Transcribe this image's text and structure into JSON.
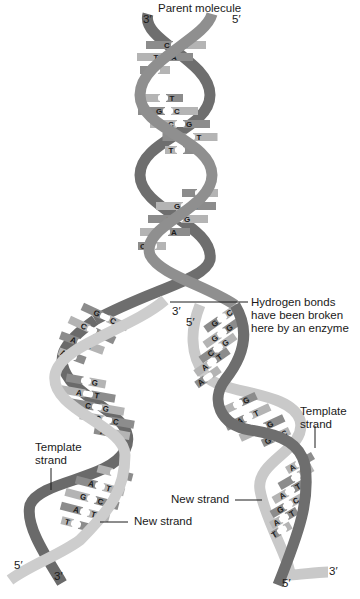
{
  "title": "Parent molecule",
  "labels": {
    "parent_molecule": "Parent molecule",
    "hydrogen_bonds_line1": "Hydrogen bonds",
    "hydrogen_bonds_line2": "have been broken",
    "hydrogen_bonds_line3": "here by an enzyme",
    "template_strand_left_line1": "Template",
    "template_strand_left_line2": "strand",
    "template_strand_right_line1": "Template",
    "template_strand_right_line2": "strand",
    "new_strand_left": "New strand",
    "new_strand_right": "New strand"
  },
  "ends": {
    "top_left": "3′",
    "top_right": "5′",
    "fork_left": "3′",
    "fork_right": "5′",
    "bottom_left_5": "5′",
    "bottom_left_3": "3′",
    "bottom_right_3": "3′",
    "bottom_right_5": "5′"
  },
  "parent_pairs": [
    [
      "C",
      "G"
    ],
    [
      "T",
      "A"
    ],
    [
      "",
      ""
    ],
    [
      "",
      "T"
    ],
    [
      "G",
      "C"
    ],
    [
      "C",
      "G"
    ],
    [
      "A",
      "T"
    ],
    [
      "T",
      ""
    ],
    [
      "",
      "T"
    ],
    [
      "G",
      "C"
    ],
    [
      "C",
      "G"
    ],
    [
      "T",
      "A"
    ],
    [
      "C",
      ""
    ]
  ],
  "fork_bases": {
    "left": [
      "A",
      "C",
      "G",
      "A"
    ],
    "right": [
      "T",
      "C",
      "G",
      "T"
    ]
  },
  "left_daughter_pairs": [
    [
      "G",
      "C"
    ],
    [
      "C",
      "G"
    ],
    [
      "A",
      "T"
    ],
    [
      "A",
      ""
    ],
    [
      "",
      "G"
    ],
    [
      "A",
      "T"
    ],
    [
      "C",
      "G"
    ],
    [
      "G",
      "C"
    ],
    [
      "A",
      ""
    ],
    [
      "",
      "T"
    ],
    [
      "A",
      "T"
    ],
    [
      "G",
      "C"
    ],
    [
      "A",
      "T"
    ],
    [
      "T",
      ""
    ]
  ],
  "right_daughter_pairs": [
    [
      "G",
      "C"
    ],
    [
      "G",
      "G"
    ],
    [
      "C",
      "G"
    ],
    [
      "A",
      "T"
    ],
    [
      "A",
      ""
    ],
    [
      "",
      "G"
    ],
    [
      "A",
      "T"
    ],
    [
      "C",
      "G"
    ],
    [
      "G",
      "C"
    ],
    [
      "A",
      ""
    ],
    [
      "",
      "T"
    ],
    [
      "A",
      "T"
    ],
    [
      "G",
      "C"
    ],
    [
      "A",
      "T"
    ],
    [
      "T",
      ""
    ]
  ],
  "colors": {
    "template_strand": "#7a7a7a",
    "template_strand_dark": "#5a5a5a",
    "new_strand": "#c8c8c8",
    "rung_dark": "#8c8c8c",
    "rung_light": "#b4b4b4",
    "hbond": "#ffffff",
    "text": "#1a1a1a"
  }
}
